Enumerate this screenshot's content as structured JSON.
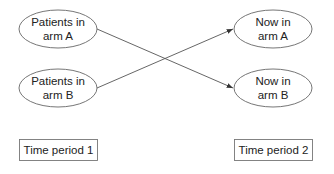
{
  "diagram": {
    "nodes": [
      {
        "id": "left-a",
        "lines": [
          "Patients in",
          "arm A"
        ]
      },
      {
        "id": "left-b",
        "lines": [
          "Patients in",
          "arm B"
        ]
      },
      {
        "id": "right-a",
        "lines": [
          "Now in",
          "arm A"
        ]
      },
      {
        "id": "right-b",
        "lines": [
          "Now in",
          "arm B"
        ]
      }
    ],
    "edges": [
      {
        "from": "left-a",
        "to": "right-b"
      },
      {
        "from": "left-b",
        "to": "right-a"
      }
    ],
    "labels": {
      "period1": "Time period 1",
      "period2": "Time period 2"
    },
    "colors": {
      "stroke": "#555555",
      "text": "#222222"
    }
  }
}
